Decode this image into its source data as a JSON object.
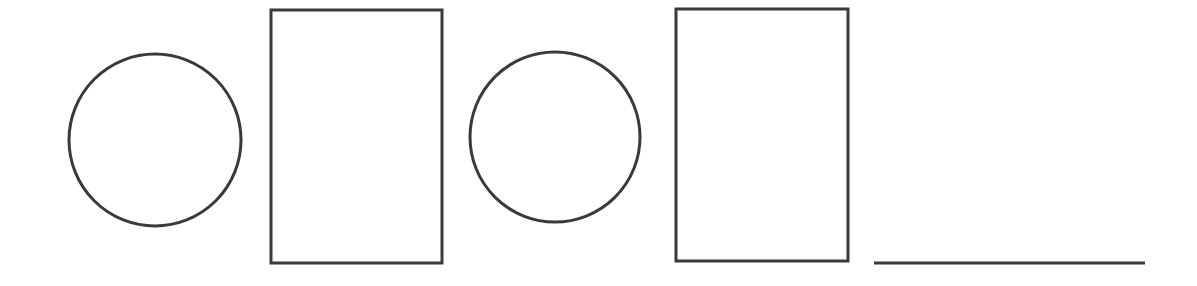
{
  "canvas": {
    "width": 1197,
    "height": 286,
    "background_color": "#ffffff"
  },
  "style": {
    "stroke_color": "#3a3a3a",
    "fill_color": "none",
    "stroke_width": 3
  },
  "figure": {
    "shape_count": 5
  },
  "shapes": [
    {
      "id": "circle-1",
      "label": "Circle 1",
      "kind": "circle",
      "cx": 155,
      "cy": 140,
      "r": 86,
      "stroke": "#3a3a3a",
      "stroke_width": 3,
      "fill": "none"
    },
    {
      "id": "rectangle-1",
      "label": "Rectangle 1",
      "kind": "rectangle",
      "x": 271,
      "y": 10,
      "width": 171,
      "height": 253,
      "stroke": "#3a3a3a",
      "stroke_width": 3,
      "fill": "none"
    },
    {
      "id": "circle-2",
      "label": "Circle 2",
      "kind": "circle",
      "cx": 555,
      "cy": 137,
      "r": 85,
      "stroke": "#3a3a3a",
      "stroke_width": 3,
      "fill": "none"
    },
    {
      "id": "rectangle-2",
      "label": "Rectangle 2",
      "kind": "rectangle",
      "x": 676,
      "y": 9,
      "width": 172,
      "height": 252,
      "stroke": "#3a3a3a",
      "stroke_width": 3,
      "fill": "none"
    },
    {
      "id": "line-1",
      "label": "Line segment",
      "kind": "line",
      "x1": 874,
      "y1": 263,
      "x2": 1145,
      "y2": 263,
      "stroke": "#3a3a3a",
      "stroke_width": 3,
      "fill": "none"
    }
  ]
}
